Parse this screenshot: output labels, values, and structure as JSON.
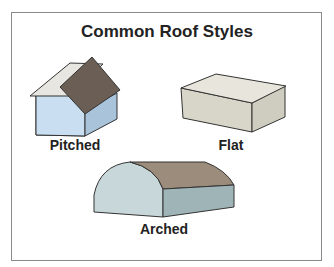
{
  "title": "Common Roof Styles",
  "figures": [
    {
      "name": "Pitched",
      "label": "Pitched"
    },
    {
      "name": "Flat",
      "label": "Flat"
    },
    {
      "name": "Arched",
      "label": "Arched"
    }
  ],
  "colors": {
    "wall_blue": "#c9def0",
    "wall_blue_dark": "#a9c3da",
    "roof_brown": "#6b5e54",
    "flat_light": "#e4e2d6",
    "flat_side": "#d2d0c2",
    "arch_front": "#c8d8da",
    "arch_side": "#9fb4b6",
    "outline": "#333333",
    "frame": "#8a8a8a"
  }
}
